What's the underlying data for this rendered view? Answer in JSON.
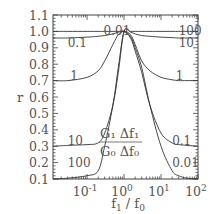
{
  "chart_data": {
    "type": "line",
    "title": "",
    "xlabel": "f1 / f0",
    "ylabel": "r",
    "xscale": "log",
    "xlim": [
      0.012,
      100
    ],
    "ylim": [
      0.1,
      1.1
    ],
    "grid": false,
    "legend": "none (curves labeled inline)",
    "x_tick_labels": [
      "10^-1",
      "10^0",
      "10^1",
      "10^2"
    ],
    "x_ticks": [
      0.1,
      1,
      10,
      100
    ],
    "y_tick_labels": [
      "0.1",
      "0.2",
      "0.3",
      "0.4",
      "0.5",
      "0.6",
      "0.7",
      "0.8",
      "0.9",
      "1.0",
      "1.1"
    ],
    "y_ticks": [
      0.1,
      0.2,
      0.3,
      0.4,
      0.5,
      0.6,
      0.7,
      0.8,
      0.9,
      1.0,
      1.1
    ],
    "parameter_label": "G1 Δf1 / G0 Δf0",
    "parameter_label_parts": {
      "num": "G₁ Δf₁",
      "den": "G₀ Δf₀"
    },
    "x": [
      0.012,
      0.03,
      0.1,
      0.2,
      0.3,
      0.5,
      0.7,
      1,
      1.5,
      2,
      3,
      5,
      10,
      20,
      30,
      50,
      100
    ],
    "series": [
      {
        "name": "0.01",
        "values": [
          1.0,
          1.0,
          1.0,
          1.0,
          1.0,
          1.0,
          1.0,
          1.0,
          0.97,
          0.9,
          0.78,
          0.55,
          0.3,
          0.15,
          0.12,
          0.105,
          0.1
        ]
      },
      {
        "name": "0.1",
        "values": [
          0.96,
          0.96,
          0.965,
          0.97,
          0.975,
          0.985,
          0.995,
          1.0,
          0.96,
          0.88,
          0.75,
          0.55,
          0.38,
          0.32,
          0.31,
          0.305,
          0.3
        ]
      },
      {
        "name": "1",
        "values": [
          0.7,
          0.7,
          0.72,
          0.76,
          0.82,
          0.92,
          0.98,
          1.0,
          0.98,
          0.92,
          0.82,
          0.76,
          0.72,
          0.705,
          0.7,
          0.7,
          0.7
        ]
      },
      {
        "name": "10",
        "values": [
          0.3,
          0.305,
          0.31,
          0.32,
          0.38,
          0.55,
          0.75,
          1.0,
          0.995,
          0.985,
          0.975,
          0.97,
          0.965,
          0.962,
          0.96,
          0.96,
          0.96
        ]
      },
      {
        "name": "100",
        "values": [
          0.1,
          0.105,
          0.12,
          0.15,
          0.3,
          0.55,
          0.78,
          1.0,
          1.0,
          1.0,
          1.0,
          1.0,
          1.0,
          1.0,
          1.0,
          1.0,
          1.0
        ]
      }
    ],
    "inline_labels": {
      "left": [
        {
          "text": "0.01",
          "x": 0.28,
          "y": 1.005
        },
        {
          "text": "0.1",
          "x": 0.03,
          "y": 0.93
        },
        {
          "text": "1",
          "x": 0.035,
          "y": 0.73
        },
        {
          "text": "10",
          "x": 0.03,
          "y": 0.33
        },
        {
          "text": "100",
          "x": 0.03,
          "y": 0.2
        }
      ],
      "right": [
        {
          "text": "100",
          "x": 30,
          "y": 1.005
        },
        {
          "text": "10",
          "x": 30,
          "y": 0.93
        },
        {
          "text": "1",
          "x": 25,
          "y": 0.73
        },
        {
          "text": "0.1",
          "x": 20,
          "y": 0.33
        },
        {
          "text": "0.01",
          "x": 20,
          "y": 0.2
        }
      ]
    }
  }
}
